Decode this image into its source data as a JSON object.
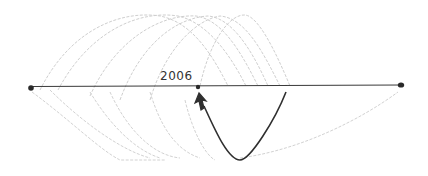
{
  "diagram": {
    "type": "hand-drawn timeline spiral sketch",
    "timeline": {
      "label": "2006",
      "start_x": 32,
      "end_x": 402,
      "y": 86
    },
    "marker": {
      "x": 198,
      "y": 87,
      "label": "2006"
    },
    "colors": {
      "ink": "#2a2a2a",
      "faint": "#c8c8c8",
      "background": "#ffffff"
    },
    "faint_loops": 6,
    "highlight_curve": "dark pencil curve rising from below the timeline with an arrow pointing up to the 2006 marker"
  }
}
